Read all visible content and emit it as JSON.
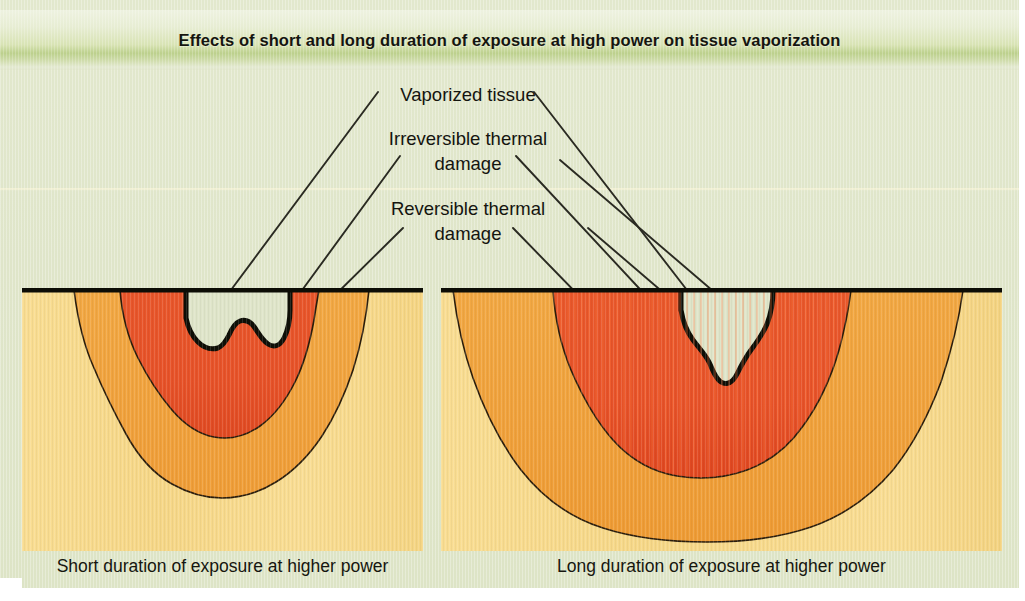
{
  "header": {
    "title": "Effects of short and long duration of exposure at high power on tissue vaporization",
    "band_color": "#bcd08c"
  },
  "page": {
    "background_color": "#dfe5c9"
  },
  "callouts": {
    "items": [
      {
        "id": "vaporized-tissue",
        "label": "Vaporized tissue",
        "lines": 1
      },
      {
        "id": "irreversible-thermal-damage",
        "label_line1": "Irreversible thermal",
        "label_line2": "damage"
      },
      {
        "id": "reversible-thermal-damage",
        "label_line1": "Reversible thermal",
        "label_line2": "damage"
      }
    ],
    "vaporized_tissue": "Vaporized tissue",
    "irreversible_line1": "Irreversible thermal",
    "irreversible_line2": "damage",
    "reversible_line1": "Reversible thermal",
    "reversible_line2": "damage"
  },
  "panels": [
    {
      "id": "short-duration",
      "caption": "Short duration of exposure at higher power",
      "crater": "narrow and deep, V-shaped",
      "zones": [
        {
          "name": "vaporized-tissue-void",
          "color": "#dfe5c9"
        },
        {
          "name": "irreversible-thermal-damage",
          "color": "#e8562a"
        },
        {
          "name": "reversible-thermal-damage",
          "color": "#f0a23e"
        },
        {
          "name": "normal-tissue",
          "color": "#f7d98a"
        }
      ]
    },
    {
      "id": "long-duration",
      "caption": "Long duration of exposure at higher power",
      "crater": "wide and broad, bowl-shaped",
      "zones": [
        {
          "name": "vaporized-tissue-void",
          "color": "#dfe5c9"
        },
        {
          "name": "irreversible-thermal-damage",
          "color": "#e8562a"
        },
        {
          "name": "reversible-thermal-damage",
          "color": "#f0a23e"
        },
        {
          "name": "normal-tissue",
          "color": "#f7d98a"
        }
      ]
    }
  ],
  "captions": {
    "left": "Short duration of exposure at higher power",
    "right": "Long duration of exposure at higher power"
  },
  "colors": {
    "tissue_surface_line": "#101008",
    "irreversible": "#e8562a",
    "reversible": "#f0a23e",
    "normal_tissue": "#f7d98a",
    "void": "#dfe5c9",
    "outline": "#241a0c"
  }
}
